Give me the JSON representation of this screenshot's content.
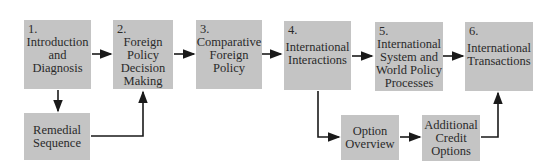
{
  "nodes": [
    {
      "id": "n1",
      "number": "1.",
      "label": "Introduction\nand\nDiagnosis"
    },
    {
      "id": "n2",
      "number": "2.",
      "label": "Foreign\nPolicy\nDecision\nMaking"
    },
    {
      "id": "n3",
      "number": "3.",
      "label": "Comparative\nForeign\nPolicy"
    },
    {
      "id": "n4",
      "number": "4.",
      "label": "International\nInteractions"
    },
    {
      "id": "n5",
      "number": "5.",
      "label": "International\nSystem and\nWorld Policy\nProcesses"
    },
    {
      "id": "n6",
      "number": "6.",
      "label": "International\nTransactions"
    },
    {
      "id": "remedial",
      "number": "",
      "label": "Remedial\nSequence"
    },
    {
      "id": "option",
      "number": "",
      "label": "Option\nOverview"
    },
    {
      "id": "credit",
      "number": "",
      "label": "Additional\nCredit\nOptions"
    }
  ],
  "edges": [
    [
      "n1",
      "n2"
    ],
    [
      "n2",
      "n3"
    ],
    [
      "n3",
      "n4"
    ],
    [
      "n4",
      "n5"
    ],
    [
      "n5",
      "n6"
    ],
    [
      "n1",
      "remedial"
    ],
    [
      "remedial",
      "n2"
    ],
    [
      "n4",
      "option"
    ],
    [
      "option",
      "credit"
    ],
    [
      "credit",
      "n6"
    ]
  ],
  "colors": {
    "box": "#c4c4c4",
    "line": "#1a1a1a"
  }
}
